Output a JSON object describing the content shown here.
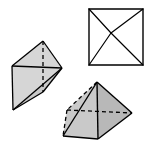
{
  "figure": {
    "canvas": {
      "width": 150,
      "height": 148,
      "background": "#ffffff"
    },
    "stroke": {
      "color": "#000000",
      "width": 1.2,
      "dash_pattern": "4,3"
    },
    "fills": {
      "light_gray": "#d6d6d6",
      "mid_gray": "#c9c9c9",
      "dark_gray": "#a9a9a9",
      "white": "#ffffff"
    },
    "shapes": [
      {
        "id": "square-with-diagonals",
        "name": "Square with diagonals (top view)",
        "kind": "plan-view",
        "fill": "#ffffff",
        "vertices": {
          "top_left": [
            89,
            9
          ],
          "top_right": [
            143,
            9
          ],
          "bottom_right": [
            143,
            65
          ],
          "bottom_left": [
            89,
            65
          ],
          "interior_point": [
            111,
            33
          ]
        },
        "outline": "89,9 143,9 143,65 89,65",
        "diagonals": [
          "89,9 111,33",
          "143,9 111,33",
          "143,65 111,33",
          "89,65 111,33"
        ]
      },
      {
        "id": "left-wedge",
        "name": "Left oblique wedge solid",
        "kind": "solid",
        "vertices": {
          "apex_top": [
            43,
            41
          ],
          "left_back": [
            12,
            66
          ],
          "right": [
            62,
            68
          ],
          "bottom": [
            13,
            110
          ],
          "hidden_mid": [
            43,
            92
          ]
        },
        "faces": [
          {
            "name": "upper-face",
            "fill": "#d6d6d6",
            "points": "43,41 62,68 12,66"
          },
          {
            "name": "front-face",
            "fill": "#d6d6d6",
            "points": "12,66 62,68 13,110"
          },
          {
            "name": "right-lower-face",
            "fill": "#c9c9c9",
            "points": "62,68 43,92 13,110"
          }
        ],
        "solid_edges": [
          "43,41 62,68",
          "43,41 12,66",
          "12,66 62,68",
          "12,66 13,110",
          "13,110 62,68",
          "13,110 43,92",
          "43,92 62,68"
        ],
        "hidden_edges": [
          "43,41 43,92"
        ]
      },
      {
        "id": "bottom-pyramid",
        "name": "Bottom-right pyramid solid",
        "kind": "solid",
        "vertices": {
          "apex": [
            97,
            82
          ],
          "front_left": [
            63,
            136
          ],
          "front_right": [
            98,
            139
          ],
          "right": [
            132,
            113
          ],
          "hidden_back": [
            67,
            110
          ]
        },
        "faces": [
          {
            "name": "left-front-face",
            "fill": "#c9c9c9",
            "points": "97,82 98,139 63,136"
          },
          {
            "name": "right-front-face",
            "fill": "#b8b8b8",
            "points": "97,82 132,113 98,139"
          },
          {
            "name": "left-back-face",
            "fill": "#c9c9c9",
            "points": "97,82 63,136 67,110"
          }
        ],
        "solid_edges": [
          "97,82 63,136",
          "97,82 132,113",
          "97,82 98,139",
          "63,136 98,139",
          "98,139 132,113"
        ],
        "hidden_edges": [
          "97,82 67,110",
          "67,110 63,136",
          "67,110 132,113"
        ]
      }
    ]
  }
}
